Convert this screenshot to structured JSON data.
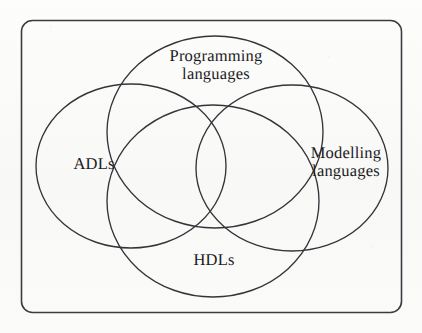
{
  "figure": {
    "type": "venn-diagram",
    "set_count": 4,
    "frame": {
      "shape": "rounded-rectangle",
      "stroke_color": "#3c3c40"
    },
    "background_color": "#fbfbfa",
    "stroke_color": "#34343a",
    "sets": [
      {
        "id": "programming-languages",
        "label": "Programming\nlanguages",
        "position": "top",
        "orientation": "horizontal-wide",
        "center": [
          215,
          132
        ],
        "radii": [
          108,
          96
        ],
        "rotation": 0
      },
      {
        "id": "adls",
        "label": "ADLs",
        "position": "left",
        "orientation": "horizontal-wide",
        "center": [
          131,
          166
        ],
        "radii": [
          95,
          82
        ],
        "rotation": 0
      },
      {
        "id": "modelling-languages",
        "label": "Modelling\nlanguages",
        "position": "right",
        "orientation": "horizontal-wide",
        "center": [
          292,
          168
        ],
        "radii": [
          96,
          83
        ],
        "rotation": 0
      },
      {
        "id": "hdls",
        "label": "HDLs",
        "position": "bottom",
        "orientation": "horizontal-wide",
        "center": [
          213,
          201
        ],
        "radii": [
          106,
          96
        ],
        "rotation": 0
      }
    ]
  },
  "labels": {
    "programming_languages": "Programming\nlanguages",
    "adls": "ADLs",
    "modelling_languages": "Modelling\nlanguages",
    "hdls": "HDLs"
  }
}
